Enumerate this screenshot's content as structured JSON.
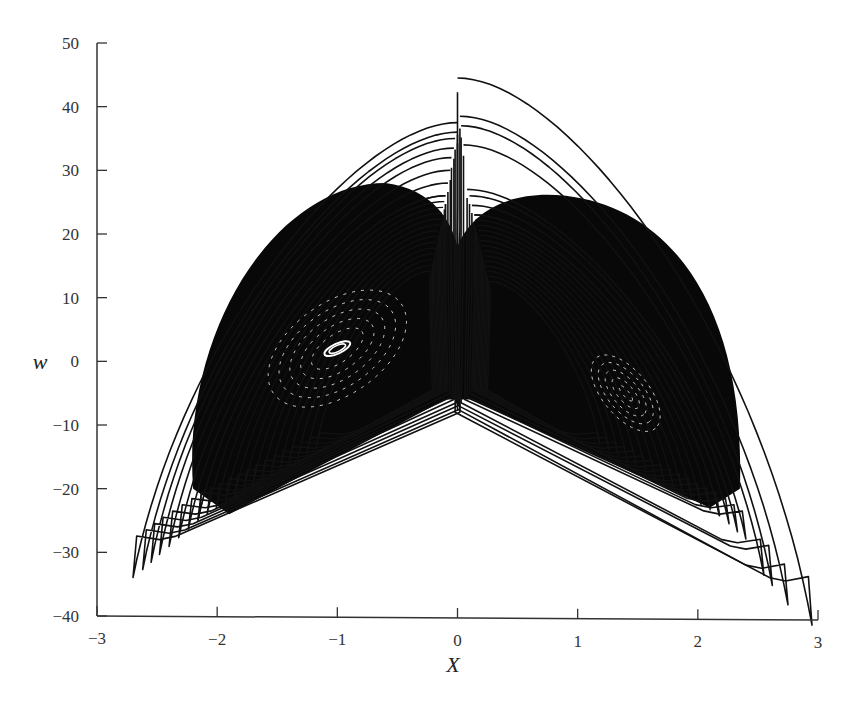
{
  "chart_data": {
    "type": "line",
    "title": "",
    "xlabel": "X",
    "ylabel": "w",
    "xlim": [
      -3,
      3
    ],
    "ylim": [
      -40,
      50
    ],
    "xticks": [
      -3,
      -2,
      -1,
      0,
      1,
      2,
      3
    ],
    "yticks": [
      -40,
      -30,
      -20,
      -10,
      0,
      10,
      20,
      30,
      40,
      50
    ],
    "xtick_labels": [
      "−3",
      "−2",
      "−1",
      "0",
      "1",
      "2",
      "3"
    ],
    "ytick_labels": [
      "−40",
      "−30",
      "−20",
      "−10",
      "0",
      "10",
      "20",
      "30",
      "40",
      "50"
    ],
    "grid": false,
    "legend": null,
    "line_color": "#111111",
    "features": {
      "left_lobe_center": [
        -1.0,
        2.0
      ],
      "right_lobe_center": [
        1.4,
        -5.0
      ],
      "max_w": 44.5,
      "max_w_at_x": 0.5,
      "min_w": -34.5,
      "min_w_at_x": 2.7,
      "left_lobe_extent_x": [
        -2.7,
        0.0
      ],
      "right_lobe_extent_x": [
        0.0,
        2.95
      ],
      "central_notch_bottom_w": -8
    },
    "series": [
      {
        "name": "left-lobe-envelopes",
        "loops": [
          {
            "cx": -1.05,
            "top": 37.5,
            "bottom": -28,
            "left": -2.7,
            "right": 0.0,
            "notch": -8
          },
          {
            "cx": -1.05,
            "top": 36.0,
            "bottom": -27,
            "left": -2.62,
            "right": 0.0,
            "notch": -7.5
          },
          {
            "cx": -1.05,
            "top": 35.0,
            "bottom": -26,
            "left": -2.55,
            "right": -0.02,
            "notch": -7
          },
          {
            "cx": -1.05,
            "top": 33.5,
            "bottom": -25,
            "left": -2.48,
            "right": -0.03,
            "notch": -6.5
          },
          {
            "cx": -1.05,
            "top": 32.0,
            "bottom": -24,
            "left": -2.4,
            "right": -0.05,
            "notch": -6
          },
          {
            "cx": -1.05,
            "top": 30.0,
            "bottom": -23,
            "left": -2.32,
            "right": -0.06,
            "notch": -5.5
          },
          {
            "cx": -1.05,
            "top": 28.0,
            "bottom": -22,
            "left": -2.24,
            "right": -0.08,
            "notch": -5
          },
          {
            "cx": -1.05,
            "top": 26.0,
            "bottom": -21,
            "left": -2.16,
            "right": -0.1,
            "notch": -4.5
          }
        ]
      },
      {
        "name": "right-lobe-envelopes",
        "loops": [
          {
            "cx": 1.3,
            "top": 44.5,
            "bottom": -34.5,
            "left": 0.0,
            "right": 2.95,
            "notch": -8
          },
          {
            "cx": 1.3,
            "top": 38.5,
            "bottom": -32.5,
            "left": 0.02,
            "right": 2.75,
            "notch": -7.5
          },
          {
            "cx": 1.3,
            "top": 37.0,
            "bottom": -29.5,
            "left": 0.03,
            "right": 2.62,
            "notch": -7
          },
          {
            "cx": 1.3,
            "top": 34.0,
            "bottom": -28.5,
            "left": 0.05,
            "right": 2.55,
            "notch": -6.5
          },
          {
            "cx": 1.3,
            "top": 27.0,
            "bottom": -24,
            "left": 0.08,
            "right": 2.4,
            "notch": -6
          },
          {
            "cx": 1.3,
            "top": 26.0,
            "bottom": -23,
            "left": 0.1,
            "right": 2.33,
            "notch": -5.5
          },
          {
            "cx": 1.3,
            "top": 24.5,
            "bottom": -22,
            "left": 0.12,
            "right": 2.26,
            "notch": -5
          },
          {
            "cx": 1.3,
            "top": 23.0,
            "bottom": -21,
            "left": 0.14,
            "right": 2.18,
            "notch": -4.5
          }
        ]
      }
    ]
  },
  "axes": {
    "x_title": "X",
    "y_title": "w"
  }
}
